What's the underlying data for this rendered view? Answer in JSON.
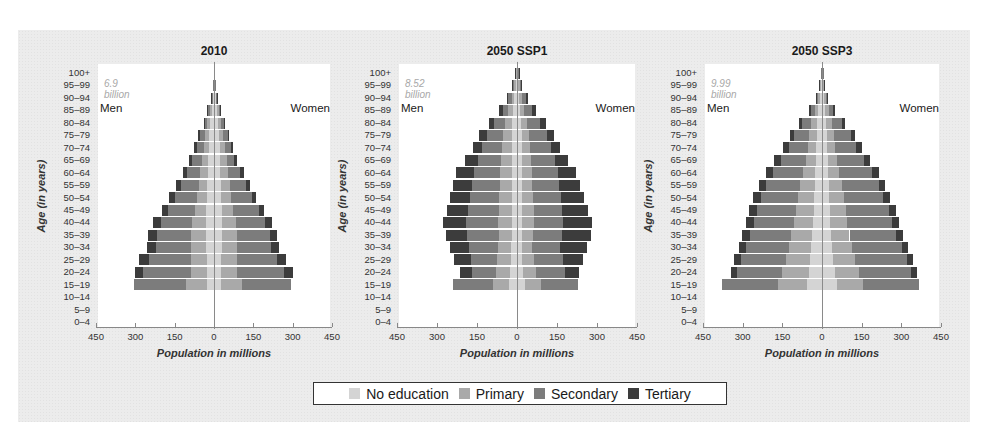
{
  "legend": {
    "items": [
      {
        "label": "No education",
        "key": "noed",
        "color": "#d4d4d4"
      },
      {
        "label": "Primary",
        "key": "prim",
        "color": "#a9a9a9"
      },
      {
        "label": "Secondary",
        "key": "sec",
        "color": "#7c7c7c"
      },
      {
        "label": "Tertiary",
        "key": "tert",
        "color": "#3c3c3c"
      }
    ]
  },
  "axis": {
    "ylabel": "Age (in years)",
    "xlabel": "Population in millions",
    "xticks": [
      "450",
      "300",
      "150",
      "0",
      "150",
      "300",
      "450"
    ],
    "age_groups": [
      "100+",
      "95–99",
      "90–94",
      "85–89",
      "80–84",
      "75–79",
      "70–74",
      "65–69",
      "60–64",
      "55–59",
      "50–54",
      "45–49",
      "40–44",
      "35–39",
      "30–34",
      "25–29",
      "20–24",
      "15–19",
      "10–14",
      "5–9",
      "0–4"
    ],
    "men_label": "Men",
    "women_label": "Women"
  },
  "chart_data": [
    {
      "type": "bar",
      "subtype": "population-pyramid",
      "title": "2010",
      "total_label": "6.9 billion",
      "xlabel": "Population in millions",
      "ylabel": "Age (in years)",
      "xlim": [
        -450,
        450
      ],
      "categories": [
        "100+",
        "95–99",
        "90–94",
        "85–89",
        "80–84",
        "75–79",
        "70–74",
        "65–69",
        "60–64",
        "55–59",
        "50–54",
        "45–49",
        "40–44",
        "35–39",
        "30–34",
        "25–29",
        "20–24",
        "15–19",
        "10–14",
        "5–9",
        "0–4"
      ],
      "series_order": [
        "No education",
        "Primary",
        "Secondary",
        "Tertiary"
      ],
      "men": [
        [
          1,
          0,
          0,
          0
        ],
        [
          2,
          1,
          1,
          0
        ],
        [
          4,
          3,
          2,
          1
        ],
        [
          8,
          8,
          6,
          3
        ],
        [
          14,
          12,
          10,
          4
        ],
        [
          18,
          16,
          18,
          8
        ],
        [
          20,
          20,
          26,
          10
        ],
        [
          22,
          24,
          36,
          12
        ],
        [
          24,
          28,
          52,
          16
        ],
        [
          26,
          32,
          66,
          20
        ],
        [
          28,
          38,
          82,
          22
        ],
        [
          30,
          44,
          100,
          26
        ],
        [
          32,
          50,
          120,
          30
        ],
        [
          32,
          56,
          130,
          32
        ],
        [
          30,
          58,
          134,
          32
        ],
        [
          28,
          60,
          160,
          38
        ],
        [
          26,
          60,
          185,
          30
        ],
        [
          25,
          80,
          200,
          0
        ],
        [
          0,
          0,
          0,
          0
        ],
        [
          0,
          0,
          0,
          0
        ],
        [
          0,
          0,
          0,
          0
        ]
      ],
      "women": [
        [
          1,
          0,
          0,
          0
        ],
        [
          3,
          1,
          1,
          0
        ],
        [
          6,
          3,
          2,
          1
        ],
        [
          10,
          8,
          5,
          2
        ],
        [
          16,
          12,
          10,
          3
        ],
        [
          20,
          16,
          16,
          6
        ],
        [
          22,
          20,
          22,
          8
        ],
        [
          24,
          24,
          30,
          10
        ],
        [
          24,
          30,
          46,
          14
        ],
        [
          26,
          34,
          62,
          16
        ],
        [
          28,
          38,
          78,
          18
        ],
        [
          30,
          44,
          96,
          22
        ],
        [
          32,
          50,
          114,
          26
        ],
        [
          32,
          56,
          126,
          28
        ],
        [
          30,
          58,
          130,
          30
        ],
        [
          28,
          60,
          152,
          36
        ],
        [
          26,
          60,
          180,
          36
        ],
        [
          25,
          80,
          190,
          0
        ],
        [
          0,
          0,
          0,
          0
        ],
        [
          0,
          0,
          0,
          0
        ],
        [
          0,
          0,
          0,
          0
        ]
      ]
    },
    {
      "type": "bar",
      "subtype": "population-pyramid",
      "title": "2050 SSP1",
      "total_label": "8.52 billion",
      "xlabel": "Population in millions",
      "ylabel": "Age (in years)",
      "xlim": [
        -450,
        450
      ],
      "categories": [
        "100+",
        "95–99",
        "90–94",
        "85–89",
        "80–84",
        "75–79",
        "70–74",
        "65–69",
        "60–64",
        "55–59",
        "50–54",
        "45–49",
        "40–44",
        "35–39",
        "30–34",
        "25–29",
        "20–24",
        "15–19",
        "10–14",
        "5–9",
        "0–4"
      ],
      "series_order": [
        "No education",
        "Primary",
        "Secondary",
        "Tertiary"
      ],
      "men": [
        [
          2,
          2,
          2,
          1
        ],
        [
          5,
          5,
          5,
          3
        ],
        [
          10,
          10,
          12,
          6
        ],
        [
          14,
          18,
          22,
          12
        ],
        [
          18,
          26,
          42,
          18
        ],
        [
          20,
          32,
          62,
          28
        ],
        [
          20,
          36,
          74,
          34
        ],
        [
          20,
          40,
          88,
          46
        ],
        [
          20,
          42,
          98,
          68
        ],
        [
          20,
          44,
          104,
          72
        ],
        [
          20,
          46,
          110,
          76
        ],
        [
          20,
          48,
          116,
          78
        ],
        [
          20,
          50,
          120,
          86
        ],
        [
          20,
          48,
          120,
          78
        ],
        [
          22,
          48,
          110,
          72
        ],
        [
          24,
          50,
          100,
          62
        ],
        [
          26,
          54,
          90,
          42
        ],
        [
          30,
          60,
          150,
          0
        ],
        [
          0,
          0,
          0,
          0
        ],
        [
          0,
          0,
          0,
          0
        ],
        [
          0,
          0,
          0,
          0
        ]
      ],
      "women": [
        [
          2,
          2,
          2,
          1
        ],
        [
          5,
          5,
          6,
          3
        ],
        [
          8,
          10,
          14,
          8
        ],
        [
          12,
          16,
          28,
          14
        ],
        [
          16,
          22,
          50,
          20
        ],
        [
          18,
          28,
          66,
          28
        ],
        [
          18,
          32,
          78,
          32
        ],
        [
          18,
          36,
          88,
          48
        ],
        [
          18,
          38,
          96,
          70
        ],
        [
          18,
          40,
          100,
          80
        ],
        [
          18,
          42,
          104,
          86
        ],
        [
          18,
          44,
          108,
          96
        ],
        [
          18,
          44,
          112,
          108
        ],
        [
          18,
          42,
          110,
          108
        ],
        [
          18,
          40,
          104,
          102
        ],
        [
          20,
          42,
          110,
          76
        ],
        [
          22,
          48,
          110,
          54
        ],
        [
          30,
          60,
          140,
          0
        ],
        [
          0,
          0,
          0,
          0
        ],
        [
          0,
          0,
          0,
          0
        ],
        [
          0,
          0,
          0,
          0
        ]
      ]
    },
    {
      "type": "bar",
      "subtype": "population-pyramid",
      "title": "2050 SSP3",
      "total_label": "9.99 billion",
      "xlabel": "Population in millions",
      "ylabel": "Age (in years)",
      "xlim": [
        -450,
        450
      ],
      "categories": [
        "100+",
        "95–99",
        "90–94",
        "85–89",
        "80–84",
        "75–79",
        "70–74",
        "65–69",
        "60–64",
        "55–59",
        "50–54",
        "45–49",
        "40–44",
        "35–39",
        "30–34",
        "25–29",
        "20–24",
        "15–19",
        "10–14",
        "5–9",
        "0–4"
      ],
      "series_order": [
        "No education",
        "Primary",
        "Secondary",
        "Tertiary"
      ],
      "men": [
        [
          1,
          1,
          1,
          0
        ],
        [
          4,
          3,
          3,
          1
        ],
        [
          8,
          6,
          6,
          3
        ],
        [
          14,
          14,
          14,
          6
        ],
        [
          18,
          22,
          34,
          14
        ],
        [
          20,
          28,
          56,
          18
        ],
        [
          22,
          32,
          70,
          22
        ],
        [
          24,
          38,
          92,
          26
        ],
        [
          26,
          46,
          112,
          28
        ],
        [
          28,
          54,
          128,
          30
        ],
        [
          30,
          60,
          140,
          30
        ],
        [
          32,
          66,
          148,
          30
        ],
        [
          34,
          72,
          150,
          30
        ],
        [
          36,
          80,
          156,
          30
        ],
        [
          40,
          86,
          160,
          28
        ],
        [
          44,
          94,
          170,
          26
        ],
        [
          50,
          100,
          170,
          26
        ],
        [
          55,
          110,
          215,
          0
        ],
        [
          0,
          0,
          0,
          0
        ],
        [
          0,
          0,
          0,
          0
        ],
        [
          0,
          0,
          0,
          0
        ]
      ],
      "women": [
        [
          1,
          1,
          1,
          0
        ],
        [
          4,
          3,
          2,
          1
        ],
        [
          8,
          6,
          6,
          3
        ],
        [
          12,
          14,
          16,
          6
        ],
        [
          16,
          20,
          40,
          12
        ],
        [
          18,
          26,
          64,
          16
        ],
        [
          20,
          30,
          80,
          20
        ],
        [
          22,
          36,
          100,
          24
        ],
        [
          24,
          42,
          124,
          24
        ],
        [
          26,
          48,
          140,
          26
        ],
        [
          28,
          54,
          150,
          26
        ],
        [
          30,
          60,
          162,
          26
        ],
        [
          32,
          64,
          168,
          26
        ],
        [
          34,
          70,
          176,
          26
        ],
        [
          38,
          76,
          188,
          24
        ],
        [
          42,
          84,
          196,
          24
        ],
        [
          48,
          92,
          198,
          20
        ],
        [
          56,
          100,
          210,
          0
        ],
        [
          0,
          0,
          0,
          0
        ],
        [
          0,
          0,
          0,
          0
        ],
        [
          0,
          0,
          0,
          0
        ]
      ]
    }
  ]
}
